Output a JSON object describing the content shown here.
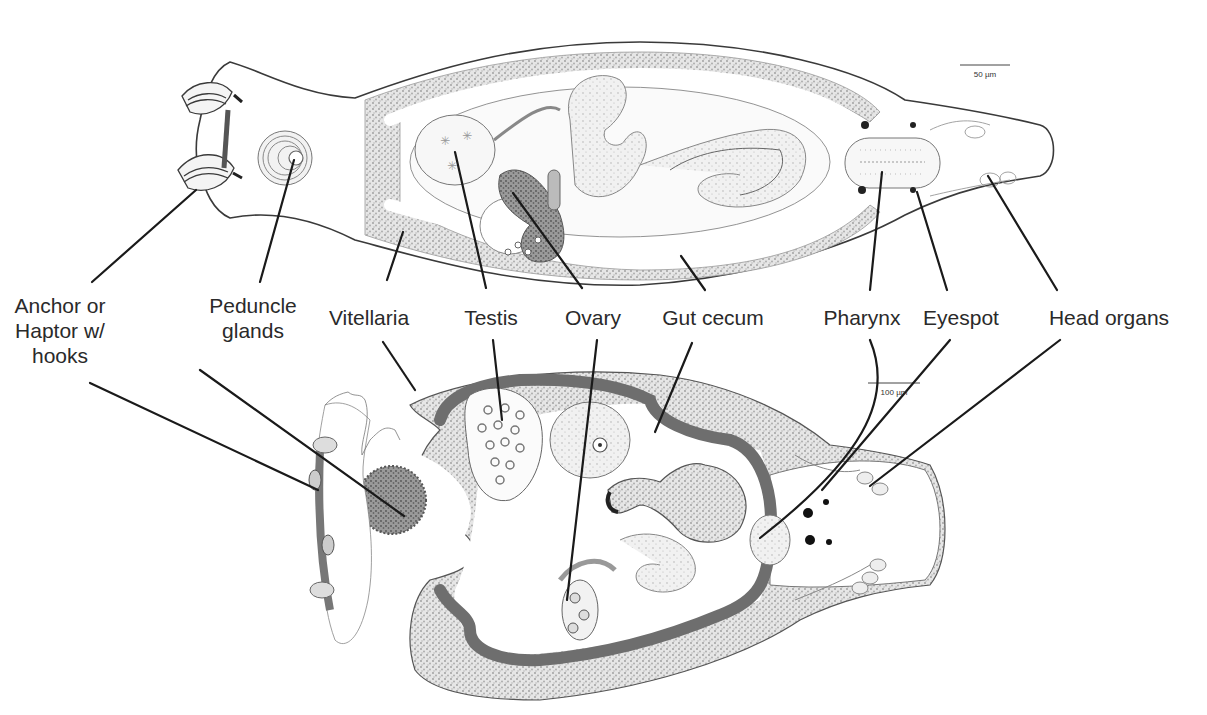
{
  "figure": {
    "top_specimen": {
      "scale_bar": "50 µm"
    },
    "bottom_specimen": {
      "scale_bar": "100 µm"
    }
  },
  "labels": [
    {
      "id": "anchor",
      "line1": "Anchor or",
      "line2": "Haptor w/",
      "line3": "hooks",
      "x": 60,
      "y": 305
    },
    {
      "id": "peduncle",
      "line1": "Peduncle",
      "line2": "glands",
      "line3": "",
      "x": 250,
      "y": 305
    },
    {
      "id": "vitellaria",
      "line1": "Vitellaria",
      "line2": "",
      "line3": "",
      "x": 370,
      "y": 318
    },
    {
      "id": "testis",
      "line1": "Testis",
      "line2": "",
      "line3": "",
      "x": 490,
      "y": 318
    },
    {
      "id": "ovary",
      "line1": "Ovary",
      "line2": "",
      "line3": "",
      "x": 590,
      "y": 318
    },
    {
      "id": "gut",
      "line1": "Gut cecum",
      "line2": "",
      "line3": "",
      "x": 720,
      "y": 318
    },
    {
      "id": "pharynx",
      "line1": "Pharynx",
      "line2": "",
      "line3": "",
      "x": 863,
      "y": 318
    },
    {
      "id": "eyespot",
      "line1": "Eyespot",
      "line2": "",
      "line3": "",
      "x": 975,
      "y": 318
    },
    {
      "id": "head",
      "line1": "Head organs",
      "line2": "",
      "line3": "",
      "x": 1105,
      "y": 318
    }
  ],
  "colors": {
    "outline": "#3a3a3a",
    "stipple": "#c8c8c8",
    "dark_gut": "#6e6e6e",
    "leader": "#1a1a1a",
    "text": "#2a2a2a"
  }
}
